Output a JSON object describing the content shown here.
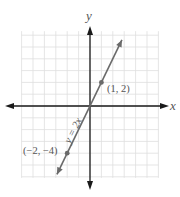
{
  "chart_data": {
    "type": "line",
    "title": "",
    "xlabel": "x",
    "ylabel": "y",
    "xlim": [
      -6,
      6
    ],
    "ylim": [
      -6,
      6
    ],
    "grid": true,
    "series": [
      {
        "name": "y = 2x",
        "equation": "y = 2x",
        "slope": 2,
        "intercept": 0,
        "x": [
          -2.9,
          2.8
        ],
        "y": [
          -5.8,
          5.6
        ]
      }
    ],
    "points": [
      {
        "x": 1,
        "y": 2,
        "label": "(1, 2)"
      },
      {
        "x": -2,
        "y": -4,
        "label": "(−2, −4)"
      }
    ],
    "annotations": [
      {
        "text": "y = 2x",
        "position": "along line, below origin"
      }
    ],
    "colors": {
      "line": "#6a6a6a",
      "axis": "#1a1a1a",
      "grid": "#dedede",
      "point": "#6a6a6a",
      "label": "#555555"
    }
  },
  "labels": {
    "x_axis": "x",
    "y_axis": "y",
    "line_equation": "y = 2x",
    "point_a": "(1, 2)",
    "point_b": "(−2, −4)"
  }
}
